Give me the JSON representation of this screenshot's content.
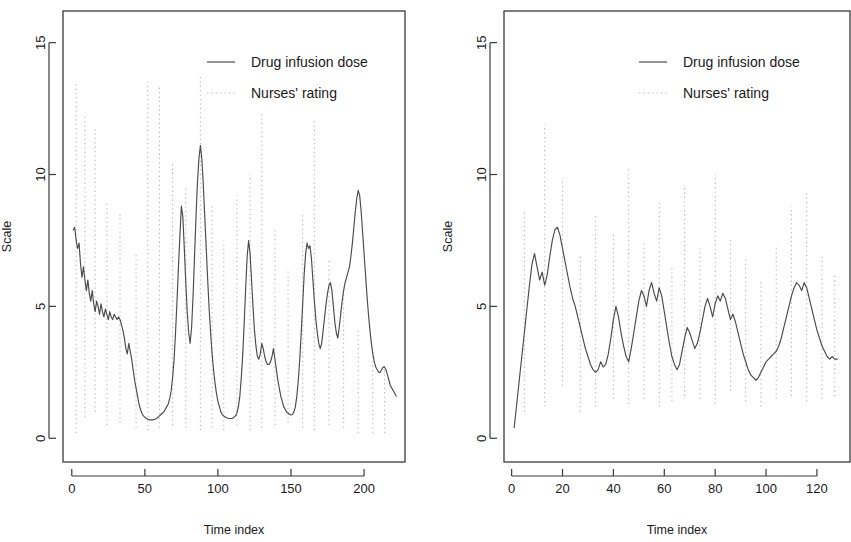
{
  "figure": {
    "background": "#ffffff",
    "line_color": "#4a4a4a",
    "dotted_color": "#b9b9b9",
    "axis_color": "#3a3a3a"
  },
  "legend": {
    "position": "top-right-inside",
    "entries": [
      {
        "label": "Drug infusion dose",
        "style": "solid",
        "color": "#4a4a4a"
      },
      {
        "label": "Nurses' rating",
        "style": "dotted",
        "color": "#b9b9b9"
      }
    ]
  },
  "chart_data": [
    {
      "type": "line",
      "panel": "left",
      "title": "",
      "xlabel": "Time index",
      "ylabel": "Scale",
      "xlim": [
        -6,
        228
      ],
      "ylim": [
        -0.9,
        16.2
      ],
      "xticks": [
        0,
        50,
        100,
        150,
        200
      ],
      "yticks": [
        0,
        5,
        10,
        15
      ],
      "grid": false,
      "series": [
        {
          "name": "Drug infusion dose",
          "style": "solid",
          "color": "#4a4a4a",
          "x": [
            1,
            2,
            3,
            4,
            5,
            6,
            7,
            8,
            9,
            10,
            11,
            12,
            13,
            14,
            15,
            16,
            17,
            18,
            19,
            20,
            21,
            22,
            23,
            24,
            25,
            26,
            27,
            28,
            29,
            30,
            31,
            32,
            33,
            34,
            35,
            36,
            37,
            38,
            39,
            40,
            41,
            42,
            43,
            44,
            45,
            46,
            47,
            48,
            49,
            50,
            51,
            52,
            53,
            54,
            55,
            56,
            57,
            58,
            59,
            60,
            61,
            62,
            63,
            64,
            65,
            66,
            67,
            68,
            69,
            70,
            71,
            72,
            73,
            74,
            75,
            76,
            77,
            78,
            79,
            80,
            81,
            82,
            83,
            84,
            85,
            86,
            87,
            88,
            89,
            90,
            91,
            92,
            93,
            94,
            95,
            96,
            97,
            98,
            99,
            100,
            101,
            102,
            103,
            104,
            105,
            106,
            107,
            108,
            109,
            110,
            111,
            112,
            113,
            114,
            115,
            116,
            117,
            118,
            119,
            120,
            121,
            122,
            123,
            124,
            125,
            126,
            127,
            128,
            129,
            130,
            131,
            132,
            133,
            134,
            135,
            136,
            137,
            138,
            139,
            140,
            141,
            142,
            143,
            144,
            145,
            146,
            147,
            148,
            149,
            150,
            151,
            152,
            153,
            154,
            155,
            156,
            157,
            158,
            159,
            160,
            161,
            162,
            163,
            164,
            165,
            166,
            167,
            168,
            169,
            170,
            171,
            172,
            173,
            174,
            175,
            176,
            177,
            178,
            179,
            180,
            181,
            182,
            183,
            184,
            185,
            186,
            187,
            188,
            189,
            190,
            191,
            192,
            193,
            194,
            195,
            196,
            197,
            198,
            199,
            200,
            201,
            202,
            203,
            204,
            205,
            206,
            207,
            208,
            209,
            210,
            211,
            212,
            213,
            214,
            215,
            216,
            217,
            218,
            219,
            220,
            221,
            222
          ],
          "y": [
            7.9,
            8.0,
            7.5,
            7.2,
            7.4,
            6.6,
            6.1,
            6.5,
            6.0,
            5.6,
            6.0,
            5.5,
            5.2,
            5.6,
            5.1,
            4.8,
            5.2,
            5.0,
            4.7,
            5.1,
            4.8,
            4.6,
            4.9,
            4.7,
            4.5,
            4.8,
            4.6,
            4.5,
            4.7,
            4.6,
            4.5,
            4.6,
            4.5,
            4.3,
            4.1,
            3.8,
            3.4,
            3.2,
            3.6,
            3.3,
            3.0,
            2.6,
            2.2,
            1.9,
            1.6,
            1.3,
            1.1,
            0.95,
            0.85,
            0.8,
            0.75,
            0.72,
            0.7,
            0.7,
            0.7,
            0.7,
            0.72,
            0.75,
            0.8,
            0.85,
            0.9,
            0.95,
            1.0,
            1.1,
            1.2,
            1.3,
            1.5,
            1.8,
            2.3,
            3.0,
            4.0,
            5.2,
            6.5,
            7.7,
            8.8,
            8.4,
            7.2,
            5.9,
            4.8,
            4.0,
            3.6,
            4.2,
            5.4,
            6.9,
            8.4,
            9.7,
            10.6,
            11.1,
            10.6,
            9.6,
            8.4,
            7.2,
            6.0,
            4.9,
            4.0,
            3.2,
            2.6,
            2.1,
            1.7,
            1.4,
            1.2,
            1.0,
            0.9,
            0.85,
            0.8,
            0.78,
            0.76,
            0.75,
            0.75,
            0.76,
            0.8,
            0.85,
            0.95,
            1.2,
            1.6,
            2.3,
            3.2,
            4.4,
            5.7,
            6.9,
            7.5,
            7.0,
            6.0,
            5.0,
            4.1,
            3.5,
            3.1,
            3.0,
            3.2,
            3.6,
            3.4,
            3.1,
            2.9,
            2.8,
            2.8,
            2.9,
            3.1,
            3.4,
            3.0,
            2.6,
            2.2,
            1.9,
            1.6,
            1.4,
            1.2,
            1.1,
            1.0,
            0.95,
            0.9,
            0.88,
            0.9,
            1.0,
            1.2,
            1.6,
            2.2,
            3.0,
            4.0,
            5.1,
            6.2,
            7.0,
            7.4,
            7.2,
            7.3,
            6.8,
            6.0,
            5.2,
            4.5,
            4.0,
            3.6,
            3.4,
            3.6,
            4.1,
            4.6,
            5.1,
            5.5,
            5.8,
            5.9,
            5.6,
            5.0,
            4.4,
            4.0,
            3.8,
            4.2,
            4.7,
            5.2,
            5.6,
            5.9,
            6.1,
            6.3,
            6.5,
            6.9,
            7.4,
            8.0,
            8.6,
            9.1,
            9.4,
            9.2,
            8.6,
            7.8,
            7.0,
            6.2,
            5.4,
            4.7,
            4.1,
            3.6,
            3.2,
            2.9,
            2.7,
            2.6,
            2.5,
            2.5,
            2.6,
            2.7,
            2.7,
            2.6,
            2.4,
            2.2,
            2.0,
            1.9,
            1.8,
            1.7,
            1.6,
            1.55,
            1.5,
            1.5,
            1.5,
            1.5
          ]
        },
        {
          "name": "Nurses' rating",
          "style": "dotted",
          "color": "#b9b9b9",
          "description": "Vertical dotted stems at irregular intervals spanning wide ranges of the scale",
          "stems": [
            {
              "x": 3,
              "y0": 0.2,
              "y1": 13.5
            },
            {
              "x": 9,
              "y0": 0.8,
              "y1": 12.2
            },
            {
              "x": 16,
              "y0": 1.0,
              "y1": 11.8
            },
            {
              "x": 24,
              "y0": 0.5,
              "y1": 9.0
            },
            {
              "x": 33,
              "y0": 0.6,
              "y1": 8.5
            },
            {
              "x": 44,
              "y0": 0.4,
              "y1": 7.0
            },
            {
              "x": 52,
              "y0": 0.3,
              "y1": 13.6
            },
            {
              "x": 60,
              "y0": 0.4,
              "y1": 13.4
            },
            {
              "x": 69,
              "y0": 0.5,
              "y1": 10.5
            },
            {
              "x": 78,
              "y0": 0.4,
              "y1": 9.5
            },
            {
              "x": 88,
              "y0": 0.3,
              "y1": 13.7
            },
            {
              "x": 96,
              "y0": 0.4,
              "y1": 8.8
            },
            {
              "x": 104,
              "y0": 0.3,
              "y1": 7.5
            },
            {
              "x": 113,
              "y0": 0.5,
              "y1": 9.2
            },
            {
              "x": 122,
              "y0": 0.3,
              "y1": 10.0
            },
            {
              "x": 130,
              "y0": 0.4,
              "y1": 12.4
            },
            {
              "x": 139,
              "y0": 0.5,
              "y1": 8.0
            },
            {
              "x": 148,
              "y0": 0.6,
              "y1": 6.4
            },
            {
              "x": 158,
              "y0": 0.4,
              "y1": 8.5
            },
            {
              "x": 166,
              "y0": 0.3,
              "y1": 12.1
            },
            {
              "x": 176,
              "y0": 0.5,
              "y1": 6.8
            },
            {
              "x": 186,
              "y0": 0.4,
              "y1": 5.5
            },
            {
              "x": 196,
              "y0": 0.2,
              "y1": 4.2
            },
            {
              "x": 206,
              "y0": 0.2,
              "y1": 3.4
            },
            {
              "x": 214,
              "y0": 0.2,
              "y1": 2.8
            }
          ]
        }
      ]
    },
    {
      "type": "line",
      "panel": "right",
      "title": "",
      "xlabel": "Time index",
      "ylabel": "Scale",
      "xlim": [
        -3,
        133
      ],
      "ylim": [
        -0.9,
        16.2
      ],
      "xticks": [
        0,
        20,
        40,
        60,
        80,
        100,
        120
      ],
      "yticks": [
        0,
        5,
        10,
        15
      ],
      "grid": false,
      "series": [
        {
          "name": "Drug infusion dose",
          "style": "solid",
          "color": "#4a4a4a",
          "x": [
            1,
            2,
            3,
            4,
            5,
            6,
            7,
            8,
            9,
            10,
            11,
            12,
            13,
            14,
            15,
            16,
            17,
            18,
            19,
            20,
            21,
            22,
            23,
            24,
            25,
            26,
            27,
            28,
            29,
            30,
            31,
            32,
            33,
            34,
            35,
            36,
            37,
            38,
            39,
            40,
            41,
            42,
            43,
            44,
            45,
            46,
            47,
            48,
            49,
            50,
            51,
            52,
            53,
            54,
            55,
            56,
            57,
            58,
            59,
            60,
            61,
            62,
            63,
            64,
            65,
            66,
            67,
            68,
            69,
            70,
            71,
            72,
            73,
            74,
            75,
            76,
            77,
            78,
            79,
            80,
            81,
            82,
            83,
            84,
            85,
            86,
            87,
            88,
            89,
            90,
            91,
            92,
            93,
            94,
            95,
            96,
            97,
            98,
            99,
            100,
            101,
            102,
            103,
            104,
            105,
            106,
            107,
            108,
            109,
            110,
            111,
            112,
            113,
            114,
            115,
            116,
            117,
            118,
            119,
            120,
            121,
            122,
            123,
            124,
            125,
            126,
            127,
            128
          ],
          "y": [
            0.4,
            1.3,
            2.2,
            3.1,
            4.0,
            4.9,
            5.8,
            6.6,
            7.0,
            6.5,
            6.0,
            6.3,
            5.8,
            6.2,
            6.9,
            7.5,
            7.9,
            8.0,
            7.7,
            7.2,
            6.7,
            6.2,
            5.7,
            5.3,
            5.0,
            4.6,
            4.2,
            3.8,
            3.4,
            3.1,
            2.8,
            2.6,
            2.5,
            2.6,
            2.9,
            2.7,
            2.8,
            3.2,
            3.8,
            4.5,
            5.0,
            4.6,
            4.0,
            3.5,
            3.1,
            2.9,
            3.4,
            4.0,
            4.6,
            5.2,
            5.6,
            5.4,
            5.0,
            5.6,
            5.9,
            5.5,
            5.2,
            5.7,
            5.4,
            4.8,
            4.2,
            3.6,
            3.1,
            2.8,
            2.6,
            2.8,
            3.3,
            3.8,
            4.2,
            4.0,
            3.7,
            3.4,
            3.6,
            4.0,
            4.5,
            5.0,
            5.3,
            5.0,
            4.6,
            5.1,
            5.4,
            5.2,
            5.5,
            5.3,
            4.9,
            4.5,
            4.7,
            4.4,
            4.0,
            3.6,
            3.2,
            2.9,
            2.6,
            2.4,
            2.3,
            2.2,
            2.3,
            2.5,
            2.7,
            2.9,
            3.0,
            3.1,
            3.2,
            3.3,
            3.5,
            3.8,
            4.2,
            4.6,
            5.0,
            5.4,
            5.7,
            5.9,
            5.8,
            5.6,
            5.9,
            5.7,
            5.3,
            4.9,
            4.5,
            4.1,
            3.8,
            3.5,
            3.3,
            3.1,
            3.0,
            3.1,
            3.0,
            3.0
          ]
        },
        {
          "name": "Nurses' rating",
          "style": "dotted",
          "color": "#b9b9b9",
          "description": "Vertical dotted stems at irregular intervals spanning wide ranges of the scale",
          "stems": [
            {
              "x": 5,
              "y0": 1.0,
              "y1": 8.6
            },
            {
              "x": 13,
              "y0": 1.2,
              "y1": 11.9
            },
            {
              "x": 20,
              "y0": 2.0,
              "y1": 9.8
            },
            {
              "x": 27,
              "y0": 1.0,
              "y1": 7.0
            },
            {
              "x": 33,
              "y0": 1.2,
              "y1": 8.5
            },
            {
              "x": 40,
              "y0": 1.5,
              "y1": 7.8
            },
            {
              "x": 46,
              "y0": 1.3,
              "y1": 10.2
            },
            {
              "x": 52,
              "y0": 1.5,
              "y1": 7.4
            },
            {
              "x": 58,
              "y0": 1.2,
              "y1": 9.0
            },
            {
              "x": 63,
              "y0": 1.4,
              "y1": 6.5
            },
            {
              "x": 68,
              "y0": 1.6,
              "y1": 9.6
            },
            {
              "x": 74,
              "y0": 1.5,
              "y1": 7.2
            },
            {
              "x": 80,
              "y0": 1.3,
              "y1": 10.0
            },
            {
              "x": 86,
              "y0": 1.8,
              "y1": 7.6
            },
            {
              "x": 92,
              "y0": 1.4,
              "y1": 6.8
            },
            {
              "x": 98,
              "y0": 1.2,
              "y1": 6.0
            },
            {
              "x": 104,
              "y0": 1.5,
              "y1": 7.3
            },
            {
              "x": 110,
              "y0": 1.6,
              "y1": 8.8
            },
            {
              "x": 116,
              "y0": 1.4,
              "y1": 9.4
            },
            {
              "x": 122,
              "y0": 1.5,
              "y1": 7.0
            },
            {
              "x": 127,
              "y0": 1.6,
              "y1": 6.2
            }
          ]
        }
      ]
    }
  ]
}
